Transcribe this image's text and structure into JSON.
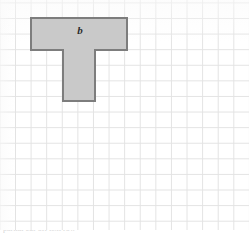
{
  "figure": {
    "type": "grid-paper-geometry-figure",
    "background": {
      "kind": "square-grid-paper",
      "grid_color": "#e3e3e3",
      "paper_color": "#ffffff",
      "cell_size_px": 15.6,
      "columns": 16,
      "rows": 15
    },
    "shape": {
      "name": "t-shape",
      "description": "T-shaped polygon (two rectangles)",
      "fill_color": "#c9c9c9",
      "stroke_color": "#7d7d7d",
      "stroke_width_px": 2,
      "label": "b",
      "label_style": "italic",
      "top_bar": {
        "cells_wide": 6,
        "cells_tall": 2,
        "x_px": 31,
        "y_px": 18,
        "width_px": 96,
        "height_px": 32
      },
      "stem": {
        "cells_wide": 2,
        "cells_tall": 3,
        "x_px": 63,
        "y_px": 50,
        "width_px": 32,
        "height_px": 51
      },
      "vertices_px": [
        [
          31,
          18
        ],
        [
          127,
          18
        ],
        [
          127,
          50
        ],
        [
          95,
          50
        ],
        [
          95,
          101
        ],
        [
          63,
          101
        ],
        [
          63,
          50
        ],
        [
          31,
          50
        ]
      ],
      "total_cells": 18
    }
  },
  "caption": {
    "visible": true,
    "text": "partial cut-off text row"
  }
}
